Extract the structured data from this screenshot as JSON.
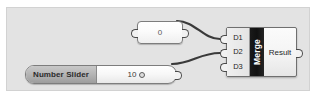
{
  "app": {
    "name": "Grasshopper Canvas",
    "canvas_background": "#e3e3e3",
    "wire_color": "#3a3a3a"
  },
  "nodes": {
    "panel": {
      "type": "panel",
      "value": "0",
      "input_port_name": "panel-input",
      "output_port_name": "panel-output"
    },
    "slider": {
      "type": "number-slider",
      "label": "Number Slider",
      "value": "10",
      "grip_icon": "slider-grip-icon",
      "output_port_name": "slider-output"
    },
    "merge": {
      "type": "component",
      "title": "Merge",
      "inputs": [
        {
          "label": "D1"
        },
        {
          "label": "D2"
        },
        {
          "label": "D3"
        }
      ],
      "output": {
        "label": "Result"
      },
      "title_band_color": "#141414",
      "title_text_color": "#ffffff"
    }
  },
  "wires": [
    {
      "name": "panel-to-d1",
      "from": "panel-output",
      "to": "D1"
    },
    {
      "name": "slider-to-d2",
      "from": "slider-output",
      "to": "D2"
    }
  ]
}
